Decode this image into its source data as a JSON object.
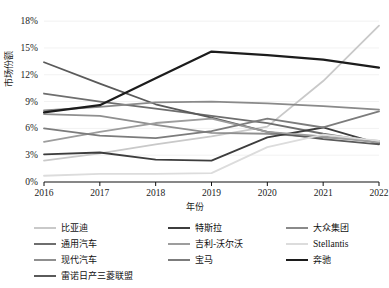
{
  "chart_data": {
    "type": "line",
    "title": "",
    "xlabel": "年份",
    "ylabel": "市场份额",
    "x": [
      2016,
      2017,
      2018,
      2019,
      2020,
      2021,
      2022
    ],
    "xtick_labels": [
      "2016",
      "2017",
      "2018",
      "2019",
      "2020",
      "2021",
      "2022"
    ],
    "ytick_labels": [
      "0%",
      "3%",
      "6%",
      "9%",
      "12%",
      "15%",
      "18%"
    ],
    "ytick_values": [
      0,
      3,
      6,
      9,
      12,
      15,
      18
    ],
    "ylim": [
      0,
      18.8
    ],
    "xlim": [
      2016,
      2022
    ],
    "grid": true,
    "legend_position": "bottom",
    "legend_columns": 3,
    "series": [
      {
        "name": "比亚迪",
        "color": "#c9c9c9",
        "values": [
          2.4,
          3.2,
          4.2,
          5.1,
          6.2,
          11.3,
          17.5
        ]
      },
      {
        "name": "通用汽车",
        "color": "#6e6e6e",
        "values": [
          9.9,
          9.0,
          8.2,
          7.4,
          6.6,
          5.4,
          4.4
        ]
      },
      {
        "name": "现代汽车",
        "color": "#8f8f8f",
        "values": [
          7.6,
          7.4,
          6.4,
          5.5,
          5.4,
          5.0,
          4.6
        ]
      },
      {
        "name": "雷诺日产三菱联盟",
        "color": "#5a5a5a",
        "values": [
          13.4,
          11.0,
          8.7,
          7.2,
          5.6,
          4.8,
          4.2
        ]
      },
      {
        "name": "特斯拉",
        "color": "#3d3d3d",
        "values": [
          3.1,
          3.3,
          2.5,
          2.4,
          5.0,
          6.1,
          4.3
        ]
      },
      {
        "name": "吉利-沃尔沃",
        "color": "#9d9d9d",
        "values": [
          4.5,
          5.6,
          6.6,
          7.1,
          5.6,
          5.1,
          4.4
        ]
      },
      {
        "name": "宝马",
        "color": "#7c7c7c",
        "values": [
          6.0,
          5.2,
          4.9,
          5.7,
          7.1,
          6.1,
          7.9
        ]
      },
      {
        "name": "大众集团",
        "color": "#8a8a8a",
        "values": [
          8.0,
          8.4,
          8.9,
          9.0,
          8.8,
          8.5,
          8.1
        ]
      },
      {
        "name": "Stellantis",
        "color": "#dcdcdc",
        "values": [
          0.7,
          0.9,
          0.9,
          1.0,
          3.9,
          5.3,
          4.6
        ]
      },
      {
        "name": "奔驰",
        "color": "#1c1c1c",
        "values": [
          7.8,
          8.6,
          11.6,
          14.6,
          14.2,
          13.7,
          12.8
        ]
      }
    ]
  },
  "axes": {
    "ylabel": "市场份额",
    "xlabel": "年份",
    "yticks": [
      "18%",
      "15%",
      "12%",
      "9%",
      "6%",
      "3%",
      "0%"
    ],
    "xticks": [
      "2016",
      "2017",
      "2018",
      "2019",
      "2020",
      "2021",
      "2022"
    ]
  },
  "legend": {
    "columns": [
      {
        "items": [
          {
            "label": "比亚迪",
            "color": "#c9c9c9",
            "width": 2.0,
            "latin": false
          },
          {
            "label": "通用汽车",
            "color": "#6e6e6e",
            "width": 2.4,
            "latin": false
          },
          {
            "label": "现代汽车",
            "color": "#8f8f8f",
            "width": 2.0,
            "latin": false
          },
          {
            "label": "雷诺日产三菱联盟",
            "color": "#5a5a5a",
            "width": 2.4,
            "latin": false
          }
        ]
      },
      {
        "items": [
          {
            "label": "特斯拉",
            "color": "#3d3d3d",
            "width": 2.4,
            "latin": false
          },
          {
            "label": "吉利-沃尔沃",
            "color": "#9d9d9d",
            "width": 2.0,
            "latin": false
          },
          {
            "label": "宝马",
            "color": "#7c7c7c",
            "width": 2.4,
            "latin": false
          }
        ]
      },
      {
        "items": [
          {
            "label": "大众集团",
            "color": "#8a8a8a",
            "width": 2.0,
            "latin": false
          },
          {
            "label": "Stellantis",
            "color": "#dcdcdc",
            "width": 2.0,
            "latin": true
          },
          {
            "label": "奔驰",
            "color": "#1c1c1c",
            "width": 2.8,
            "latin": false
          }
        ]
      }
    ]
  }
}
